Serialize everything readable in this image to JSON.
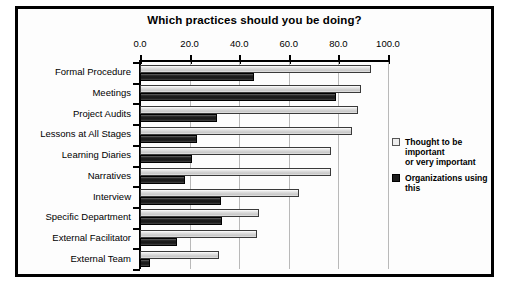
{
  "chart_data": {
    "type": "bar",
    "orientation": "horizontal",
    "title": "Which practices should you be doing?",
    "xlabel": "",
    "ylabel": "",
    "xlim": [
      0.0,
      100.0
    ],
    "xticks": [
      "0.0",
      "20.0",
      "40.0",
      "60.0",
      "80.0",
      "100.0"
    ],
    "xtick_values": [
      0,
      20,
      40,
      60,
      80,
      100
    ],
    "grid": true,
    "legend_position": "right",
    "categories": [
      "Formal Procedure",
      "Meetings",
      "Project Audits",
      "Lessons at All Stages",
      "Learning Diaries",
      "Narratives",
      "Interview",
      "Specific Department",
      "External Facilitator",
      "External Team"
    ],
    "series": [
      {
        "name": "Thought to be important or very important",
        "color": "#d8d8d8",
        "values": [
          93,
          89,
          88,
          85.5,
          77,
          77,
          64,
          48,
          47,
          32
        ]
      },
      {
        "name": "Organizations using this",
        "color": "#1d1d1d",
        "values": [
          46,
          79,
          31,
          23,
          21,
          18,
          32.5,
          33,
          15,
          4
        ]
      }
    ]
  },
  "legend": {
    "items": [
      {
        "label_line1": "Thought to be important",
        "label_line2": "or very important",
        "swatch": "light"
      },
      {
        "label_line1": "Organizations using this",
        "label_line2": "",
        "swatch": "dark"
      }
    ]
  }
}
